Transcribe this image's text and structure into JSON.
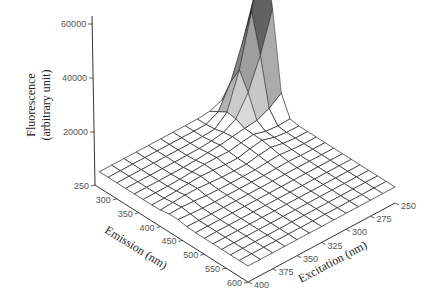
{
  "chart_data": {
    "type": "surface3d",
    "title": "",
    "zlabel": "Fluorescence\n(arbitrary unit)",
    "zlabel_lines": [
      "Fluorescence",
      "(arbitrary unit)"
    ],
    "xlabel": "Emission (nm)",
    "ylabel": "Excitation (nm)",
    "z_ticks": [
      20000,
      40000,
      60000
    ],
    "z_tick_labels": [
      "20000",
      "40000",
      "60000"
    ],
    "x_ticks": [
      250,
      300,
      350,
      400,
      450,
      500,
      550,
      600
    ],
    "x_tick_labels": [
      "250",
      "300",
      "350",
      "400",
      "450",
      "500",
      "550",
      "600"
    ],
    "y_ticks": [
      250,
      275,
      300,
      325,
      350,
      375,
      400
    ],
    "y_tick_labels": [
      "250",
      "275",
      "300",
      "325",
      "350",
      "375",
      "400"
    ],
    "xlim": [
      250,
      600
    ],
    "ylim": [
      250,
      400
    ],
    "zlim": [
      0,
      62000
    ],
    "grid": false,
    "legend": null,
    "emission_nm": [
      260,
      280,
      300,
      320,
      340,
      360,
      380,
      400,
      420,
      440,
      460,
      480,
      500,
      520,
      540,
      560,
      580,
      600
    ],
    "excitation_nm": [
      250,
      262.5,
      275,
      287.5,
      300,
      312.5,
      325,
      337.5,
      350,
      362.5,
      375,
      387.5,
      400
    ],
    "peak": {
      "emission_nm": 300,
      "excitation_nm": 260,
      "value": 62000
    }
  },
  "colors": {
    "mesh": "#222222",
    "axis": "#333333",
    "tick_label": "#555555",
    "peak_dark": "#3a3a3a",
    "peak_light": "#eeeeee"
  }
}
